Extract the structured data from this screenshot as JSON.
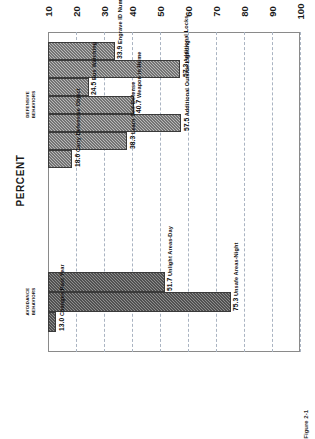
{
  "figure": {
    "caption": "Figure 2-1",
    "axis_title": "PERCENT"
  },
  "chart_data": {
    "type": "bar",
    "title": "",
    "subtitle": "",
    "xlabel": "",
    "ylabel": "PERCENT",
    "ylim": [
      10,
      100
    ],
    "yticks": [
      10,
      20,
      30,
      40,
      50,
      60,
      70,
      80,
      90,
      100
    ],
    "grid": true,
    "orientation": "vertical",
    "legend": "none",
    "groups": [
      {
        "name": "DEFENSIVE BEHAVIORS",
        "label": "DEFENSIVE\nBEHAVIORS",
        "color": "#b9b9b9",
        "categories": [
          "Engrave ID Numbers",
          "Additional Locks",
          "Bus Watching",
          "Weapon in Home",
          "Additional Outside Lighting",
          "Learn Self-Defense",
          "Carry Defensive Object"
        ],
        "values": [
          33.9,
          57.3,
          24.5,
          40.7,
          57.5,
          38.3,
          18.6
        ]
      },
      {
        "name": "AVOIDANCE BEHAVIORS",
        "label": "AVOIDANCE\nBEHAVIORS",
        "color": "#8e8e8e",
        "categories": [
          "Unlight Areas-Day",
          "Unsafe Areas-Night",
          "Changes Past Year"
        ],
        "values": [
          51.7,
          75.3,
          13.0
        ]
      }
    ]
  },
  "ticks": {
    "t10": "10",
    "t20": "20",
    "t30": "30",
    "t40": "40",
    "t50": "50",
    "t60": "60",
    "t70": "70",
    "t80": "80",
    "t90": "90",
    "t100": "100"
  },
  "bars": [
    {
      "value": "33.9",
      "name": "Engrave ID Numbers",
      "group": "defensive"
    },
    {
      "value": "57.3",
      "name": "Additional Locks",
      "group": "defensive"
    },
    {
      "value": "24.5",
      "name": "Bus Watching",
      "group": "defensive"
    },
    {
      "value": "40.7",
      "name": "Weapon in Home",
      "group": "defensive"
    },
    {
      "value": "57.5",
      "name": "Additional Outside Lighting",
      "group": "defensive"
    },
    {
      "value": "38.3",
      "name": "Learn Self-Defense",
      "group": "defensive"
    },
    {
      "value": "18.6",
      "name": "Carry Defensive Object",
      "group": "defensive"
    },
    {
      "value": "51.7",
      "name": "Unlight Areas-Day",
      "group": "avoidance"
    },
    {
      "value": "75.3",
      "name": "Unsafe Areas-Night",
      "group": "avoidance"
    },
    {
      "value": "13.0",
      "name": "Changes Past Year",
      "group": "avoidance"
    }
  ],
  "group_labels": {
    "defensive": "DEFENSIVE\nBEHAVIORS",
    "avoidance": "AVOIDANCE\nBEHAVIORS"
  }
}
